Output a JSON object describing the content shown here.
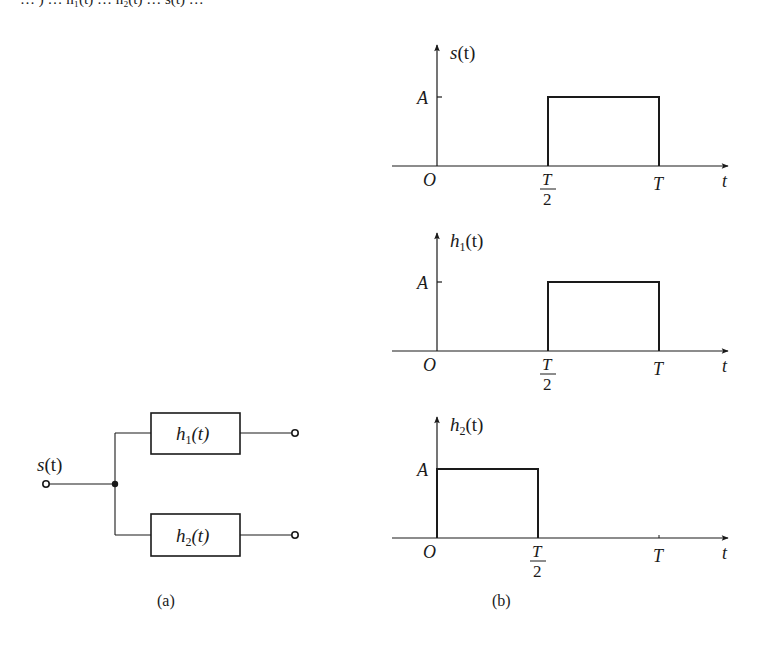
{
  "top_fragment": "… ) … h₁(t) … h₂(t) … s(t) …",
  "diagram_a": {
    "caption": "(a)",
    "input_label": "s",
    "input_label_arg": "(t)",
    "blocks": [
      {
        "name": "h",
        "sub": "1",
        "arg": "(t)"
      },
      {
        "name": "h",
        "sub": "2",
        "arg": "(t)"
      }
    ]
  },
  "diagram_b": {
    "caption": "(b)",
    "plots": [
      {
        "ylabel": "s",
        "ysub": "",
        "yarg": "(t)",
        "amplitude_label": "A",
        "origin_label": "O",
        "xlabel": "t",
        "tick_half": {
          "num": "T",
          "den": "2"
        },
        "tick_full": "T",
        "pulse_start": 0.5,
        "pulse_end": 1.0,
        "amplitude": 1
      },
      {
        "ylabel": "h",
        "ysub": "1",
        "yarg": "(t)",
        "amplitude_label": "A",
        "origin_label": "O",
        "xlabel": "t",
        "tick_half": {
          "num": "T",
          "den": "2"
        },
        "tick_full": "T",
        "pulse_start": 0.5,
        "pulse_end": 1.0,
        "amplitude": 1
      },
      {
        "ylabel": "h",
        "ysub": "2",
        "yarg": "(t)",
        "amplitude_label": "A",
        "origin_label": "O",
        "xlabel": "t",
        "tick_half": {
          "num": "T",
          "den": "2"
        },
        "tick_full": "T",
        "pulse_start": 0.0,
        "pulse_end": 0.5,
        "amplitude": 1
      }
    ]
  }
}
